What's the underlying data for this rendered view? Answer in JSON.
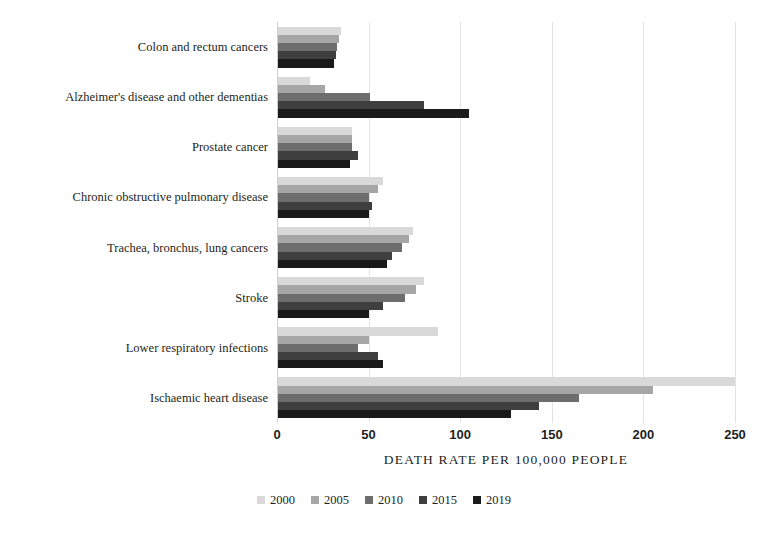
{
  "chart_data": {
    "type": "bar",
    "orientation": "horizontal",
    "title": "",
    "subtitle": "",
    "xlabel": "DEATH RATE PER 100,000 PEOPLE",
    "ylabel": "",
    "xlim": [
      0,
      250
    ],
    "xticks": [
      0,
      50,
      100,
      150,
      200,
      250
    ],
    "xtick_labels": [
      "0",
      "50",
      "100",
      "150",
      "200",
      "250"
    ],
    "grid": "vertical",
    "legend_position": "bottom-center",
    "categories": [
      "Colon and rectum cancers",
      "Alzheimer's disease and other dementias",
      "Prostate cancer",
      "Chronic obstructive pulmonary disease",
      "Trachea, bronchus, lung cancers",
      "Stroke",
      "Lower respiratory infections",
      "Ischaemic heart disease"
    ],
    "series": [
      {
        "name": "2000",
        "color": "#d9d9d9",
        "values": [
          35,
          18,
          41,
          58,
          74,
          80,
          88,
          250
        ]
      },
      {
        "name": "2005",
        "color": "#a6a6a6",
        "values": [
          34,
          26,
          41,
          55,
          72,
          76,
          50,
          205
        ]
      },
      {
        "name": "2010",
        "color": "#6d6d6d",
        "values": [
          33,
          51,
          41,
          50,
          68,
          70,
          44,
          165
        ]
      },
      {
        "name": "2015",
        "color": "#3f3f3f",
        "values": [
          32,
          80,
          44,
          52,
          63,
          58,
          55,
          143
        ]
      },
      {
        "name": "2019",
        "color": "#1a1a1a",
        "values": [
          31,
          105,
          40,
          50,
          60,
          50,
          58,
          128
        ]
      }
    ]
  }
}
